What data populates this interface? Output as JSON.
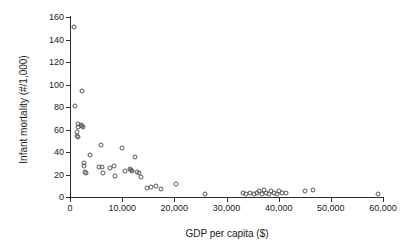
{
  "chart_data": {
    "type": "scatter",
    "title": "",
    "xlabel": "GDP per capita ($)",
    "ylabel": "Infant mortality (#/1,000)",
    "xlim": [
      0,
      60000
    ],
    "ylim": [
      0,
      160
    ],
    "xticks": [
      0,
      10000,
      20000,
      30000,
      40000,
      50000,
      60000
    ],
    "xticklabels": [
      "0",
      "10,000",
      "20,000",
      "30,000",
      "40,000",
      "50,000",
      "60,000"
    ],
    "yticks": [
      0,
      20,
      40,
      60,
      80,
      100,
      120,
      140,
      160
    ],
    "yticklabels": [
      "0",
      "20",
      "40",
      "60",
      "80",
      "100",
      "120",
      "140",
      "160"
    ],
    "grid": false,
    "legend": null,
    "marker": "open-circle",
    "marker_color": "#555555",
    "points": [
      {
        "x": 800,
        "y": 151
      },
      {
        "x": 900,
        "y": 81
      },
      {
        "x": 2300,
        "y": 94
      },
      {
        "x": 1500,
        "y": 65
      },
      {
        "x": 1600,
        "y": 62
      },
      {
        "x": 1400,
        "y": 58
      },
      {
        "x": 1300,
        "y": 54
      },
      {
        "x": 1500,
        "y": 53
      },
      {
        "x": 2100,
        "y": 64
      },
      {
        "x": 2300,
        "y": 63
      },
      {
        "x": 2400,
        "y": 62
      },
      {
        "x": 2600,
        "y": 30
      },
      {
        "x": 2700,
        "y": 28
      },
      {
        "x": 2900,
        "y": 22
      },
      {
        "x": 3000,
        "y": 21
      },
      {
        "x": 3900,
        "y": 37
      },
      {
        "x": 5900,
        "y": 46
      },
      {
        "x": 5600,
        "y": 27
      },
      {
        "x": 6200,
        "y": 27
      },
      {
        "x": 6400,
        "y": 21
      },
      {
        "x": 7600,
        "y": 26
      },
      {
        "x": 8400,
        "y": 28
      },
      {
        "x": 8600,
        "y": 19
      },
      {
        "x": 9900,
        "y": 44
      },
      {
        "x": 10600,
        "y": 23
      },
      {
        "x": 11500,
        "y": 25
      },
      {
        "x": 11700,
        "y": 24
      },
      {
        "x": 11800,
        "y": 23
      },
      {
        "x": 12500,
        "y": 36
      },
      {
        "x": 12800,
        "y": 22
      },
      {
        "x": 13200,
        "y": 21
      },
      {
        "x": 13600,
        "y": 18
      },
      {
        "x": 14800,
        "y": 8
      },
      {
        "x": 15600,
        "y": 9
      },
      {
        "x": 16400,
        "y": 10
      },
      {
        "x": 17400,
        "y": 7
      },
      {
        "x": 20400,
        "y": 12
      },
      {
        "x": 25900,
        "y": 3
      },
      {
        "x": 33200,
        "y": 4
      },
      {
        "x": 33800,
        "y": 3
      },
      {
        "x": 34600,
        "y": 4
      },
      {
        "x": 35200,
        "y": 3
      },
      {
        "x": 35800,
        "y": 4
      },
      {
        "x": 36300,
        "y": 5
      },
      {
        "x": 36800,
        "y": 3
      },
      {
        "x": 37200,
        "y": 6
      },
      {
        "x": 37600,
        "y": 4
      },
      {
        "x": 38100,
        "y": 3
      },
      {
        "x": 38600,
        "y": 5
      },
      {
        "x": 39100,
        "y": 4
      },
      {
        "x": 39600,
        "y": 3
      },
      {
        "x": 40100,
        "y": 5
      },
      {
        "x": 40600,
        "y": 4
      },
      {
        "x": 41400,
        "y": 4
      },
      {
        "x": 45100,
        "y": 5
      },
      {
        "x": 46600,
        "y": 6
      },
      {
        "x": 59000,
        "y": 3
      }
    ]
  }
}
